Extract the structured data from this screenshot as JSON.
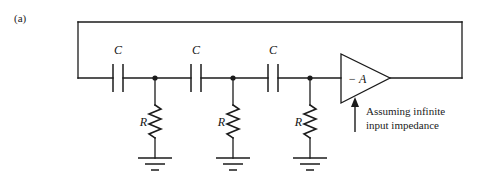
{
  "figure": {
    "panel_label": "(a)",
    "stroke_color": "#1b1b1b",
    "background_color": "#ffffff"
  },
  "capacitors": [
    {
      "label": "C",
      "x": 118,
      "label_x": 118,
      "label_y": 50
    },
    {
      "label": "C",
      "x": 196,
      "label_x": 196,
      "label_y": 50
    },
    {
      "label": "C",
      "x": 273,
      "label_x": 273,
      "label_y": 50
    }
  ],
  "resistors": [
    {
      "label": "R",
      "x": 155,
      "label_x": 147,
      "label_y": 122
    },
    {
      "label": "R",
      "x": 233,
      "label_x": 225,
      "label_y": 122
    },
    {
      "label": "R",
      "x": 310,
      "label_x": 302,
      "label_y": 122
    }
  ],
  "amplifier": {
    "gain_label": "− A",
    "gain_label_x": 350,
    "gain_label_y": 79
  },
  "annotation": {
    "line1": "Assuming infinite",
    "line2": "input impedance"
  },
  "grounds": [
    {
      "x": 155
    },
    {
      "x": 233
    },
    {
      "x": 310
    }
  ]
}
